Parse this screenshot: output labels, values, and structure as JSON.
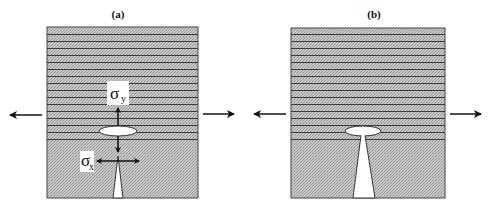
{
  "figure": {
    "panels": [
      {
        "id": "a",
        "label": "(a)",
        "stress_labels": {
          "sigma_y": {
            "symbol": "σ",
            "subscript": "y"
          },
          "sigma_x": {
            "symbol": "σ",
            "subscript": "x"
          }
        }
      },
      {
        "id": "b",
        "label": "(b)"
      }
    ],
    "colors": {
      "fill_gray": "#bdbdbd",
      "line_dark": "#333333",
      "border": "#444444",
      "arrow": "#111111",
      "void_white": "#ffffff"
    }
  }
}
